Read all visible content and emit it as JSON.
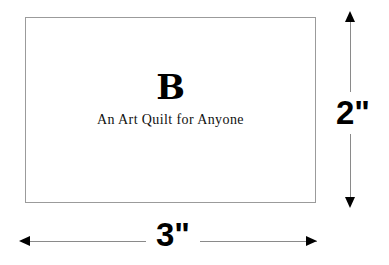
{
  "diagram": {
    "block": {
      "letter": "B",
      "tagline": "An Art Quilt for Anyone",
      "border_color": "#9b9b9b",
      "fill_color": "#ffffff"
    },
    "dimensions": {
      "width_label": "3\"",
      "height_label": "2\"",
      "line_color": "#8a8a8a",
      "arrow_color": "#000000"
    }
  }
}
